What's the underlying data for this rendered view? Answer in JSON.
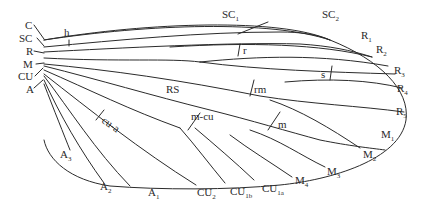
{
  "figure": {
    "stroke_color": "#2b2b2b",
    "background": "#ffffff"
  },
  "labels": {
    "base": {
      "C": "C",
      "SC": "SC",
      "R": "R",
      "M": "M",
      "CU": "CU",
      "A": "A"
    },
    "crossveins": {
      "h": "h",
      "r": "r",
      "s": "s",
      "rm": "rm",
      "m": "m",
      "m_cu": "m-cu",
      "cu_a": "cu-a"
    },
    "sectors": {
      "RS": "RS"
    },
    "margin": [
      {
        "id": "sc1",
        "main": "SC",
        "sub": "1"
      },
      {
        "id": "sc2",
        "main": "SC",
        "sub": "2"
      },
      {
        "id": "r1",
        "main": "R",
        "sub": "1"
      },
      {
        "id": "r2",
        "main": "R",
        "sub": "2"
      },
      {
        "id": "r3",
        "main": "R",
        "sub": "3"
      },
      {
        "id": "r4",
        "main": "R",
        "sub": "4"
      },
      {
        "id": "r5",
        "main": "R",
        "sub": "5"
      },
      {
        "id": "m1",
        "main": "M",
        "sub": "1"
      },
      {
        "id": "m2",
        "main": "M",
        "sub": "2"
      },
      {
        "id": "m3",
        "main": "M",
        "sub": "3"
      },
      {
        "id": "m4",
        "main": "M",
        "sub": "4"
      },
      {
        "id": "cu1a",
        "main": "CU",
        "sub": "1a"
      },
      {
        "id": "cu1b",
        "main": "CU",
        "sub": "1b"
      },
      {
        "id": "cu2",
        "main": "CU",
        "sub": "2"
      },
      {
        "id": "a1",
        "main": "A",
        "sub": "1"
      },
      {
        "id": "a2",
        "main": "A",
        "sub": "2"
      },
      {
        "id": "a3",
        "main": "A",
        "sub": "3"
      }
    ]
  }
}
